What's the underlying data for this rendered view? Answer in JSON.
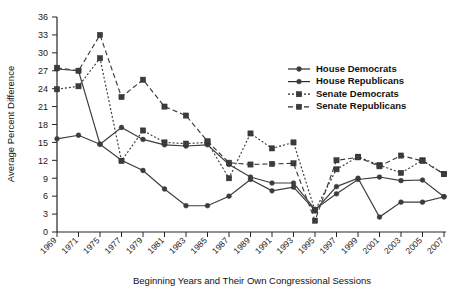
{
  "chart_data": {
    "type": "line",
    "title": "",
    "xlabel": "Beginning Years and Their Own Congressional Sessions",
    "ylabel": "Average Percent Difference",
    "categories": [
      "1969",
      "1971",
      "1975",
      "1977",
      "1979",
      "1981",
      "1983",
      "1985",
      "1987",
      "1989",
      "1991",
      "1993",
      "1995",
      "1997",
      "1999",
      "2001",
      "2003",
      "2005",
      "2007"
    ],
    "x": [
      "1969",
      "1971",
      "1975",
      "1977",
      "1979",
      "1981",
      "1983",
      "1985",
      "1987",
      "1989",
      "1991",
      "1993",
      "1995",
      "1997",
      "1999",
      "2001",
      "2003",
      "2005",
      "2007"
    ],
    "ylim": [
      0,
      36
    ],
    "yticks": [
      0,
      3,
      6,
      9,
      12,
      15,
      18,
      21,
      24,
      27,
      30,
      33,
      36
    ],
    "grid": false,
    "legend_position": "upper-right",
    "series": [
      {
        "name": "House Democrats",
        "marker": "circle",
        "dash": "solid",
        "color": "#3c3c3c",
        "values": [
          27.3,
          27.0,
          14.7,
          17.5,
          15.5,
          14.6,
          14.4,
          14.6,
          11.3,
          9.2,
          8.2,
          8.2,
          3.8,
          6.4,
          8.8,
          9.2,
          8.6,
          8.7,
          5.9
        ]
      },
      {
        "name": "House Republicans",
        "marker": "circle",
        "dash": "solid",
        "color": "#3c3c3c",
        "values": [
          15.6,
          16.2,
          14.7,
          12.0,
          10.3,
          7.2,
          4.4,
          4.4,
          6.0,
          8.8,
          6.9,
          7.5,
          3.6,
          7.6,
          9.0,
          2.5,
          5.0,
          5.0,
          5.9
        ]
      },
      {
        "name": "Senate Democrats",
        "marker": "square",
        "dash": "dotted",
        "color": "#3c3c3c",
        "values": [
          23.9,
          24.4,
          29.1,
          11.9,
          17.0,
          15.0,
          14.8,
          15.0,
          9.0,
          16.5,
          14.0,
          15.0,
          3.6,
          10.5,
          12.6,
          11.2,
          9.9,
          12.0,
          9.7
        ]
      },
      {
        "name": "Senate Republicans",
        "marker": "square",
        "dash": "dashed",
        "color": "#3c3c3c",
        "values": [
          27.5,
          27.0,
          33.0,
          22.6,
          25.5,
          21.0,
          19.5,
          15.2,
          11.6,
          11.3,
          11.4,
          11.5,
          1.9,
          12.0,
          12.5,
          11.0,
          12.8,
          11.9,
          9.7
        ]
      }
    ],
    "legend": [
      "House Democrats",
      "House Republicans",
      "Senate Democrats",
      "Senate Republicans"
    ]
  }
}
